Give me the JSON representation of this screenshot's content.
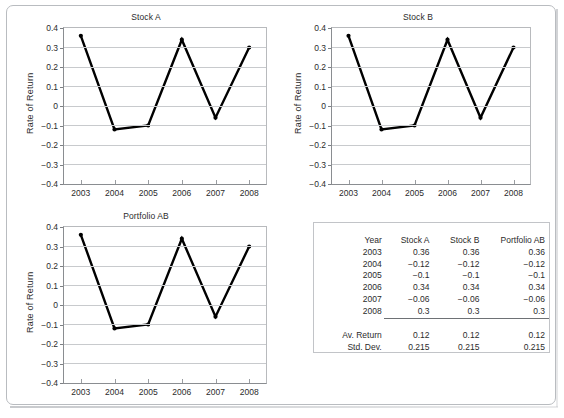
{
  "figure": {
    "background": "#ffffff",
    "line_color": "#000000",
    "grid_color": "#c8cacd",
    "axis_color": "#8a8d91",
    "text_color": "#2b2b2b"
  },
  "panels": [
    {
      "id": "stock-a",
      "title": "Stock A",
      "ylabel": "Rate of Return"
    },
    {
      "id": "stock-b",
      "title": "Stock B",
      "ylabel": "Rate of Return"
    },
    {
      "id": "portfolio-ab",
      "title": "Portfolio AB",
      "ylabel": "Rate of Return"
    }
  ],
  "axis": {
    "y_ticks": [
      "0.4",
      "0.3",
      "0.2",
      "0.1",
      "0",
      "-0.1",
      "-0.2",
      "-0.3",
      "-0.4"
    ],
    "x_ticks": [
      "2003",
      "2004",
      "2005",
      "2006",
      "2007",
      "2008"
    ],
    "ylim": [
      -0.4,
      0.4
    ]
  },
  "chart_data": [
    {
      "type": "line",
      "title": "Stock A",
      "xlabel": "",
      "ylabel": "Rate of Return",
      "x": [
        "2003",
        "2004",
        "2005",
        "2006",
        "2007",
        "2008"
      ],
      "values": [
        0.36,
        -0.12,
        -0.1,
        0.34,
        -0.06,
        0.3
      ],
      "ylim": [
        -0.4,
        0.4
      ],
      "ytick_step": 0.1,
      "grid": true,
      "legend": "none",
      "markers": true,
      "marker_style": "filled-circle",
      "line_color": "#000000"
    },
    {
      "type": "line",
      "title": "Stock B",
      "xlabel": "",
      "ylabel": "Rate of Return",
      "x": [
        "2003",
        "2004",
        "2005",
        "2006",
        "2007",
        "2008"
      ],
      "values": [
        0.36,
        -0.12,
        -0.1,
        0.34,
        -0.06,
        0.3
      ],
      "ylim": [
        -0.4,
        0.4
      ],
      "ytick_step": 0.1,
      "grid": true,
      "legend": "none",
      "markers": true,
      "marker_style": "filled-circle",
      "line_color": "#000000"
    },
    {
      "type": "line",
      "title": "Portfolio AB",
      "xlabel": "",
      "ylabel": "Rate of Return",
      "x": [
        "2003",
        "2004",
        "2005",
        "2006",
        "2007",
        "2008"
      ],
      "values": [
        0.36,
        -0.12,
        -0.1,
        0.34,
        -0.06,
        0.3
      ],
      "ylim": [
        -0.4,
        0.4
      ],
      "ytick_step": 0.1,
      "grid": true,
      "legend": "none",
      "markers": true,
      "marker_style": "filled-circle",
      "line_color": "#000000"
    },
    {
      "type": "table",
      "title": "",
      "columns": [
        "Year",
        "Stock A",
        "Stock B",
        "Portfolio AB"
      ],
      "rows": [
        [
          "2003",
          "0.36",
          "0.36",
          "0.36"
        ],
        [
          "2004",
          "-0.12",
          "-0.12",
          "-0.12"
        ],
        [
          "2005",
          "-0.1",
          "-0.1",
          "-0.1"
        ],
        [
          "2006",
          "0.34",
          "0.34",
          "0.34"
        ],
        [
          "2007",
          "-0.06",
          "-0.06",
          "-0.06"
        ],
        [
          "2008",
          "0.3",
          "0.3",
          "0.3"
        ]
      ],
      "summary": [
        [
          "Av. Return",
          "0.12",
          "0.12",
          "0.12"
        ],
        [
          "Std. Dev.",
          "0.215",
          "0.215",
          "0.215"
        ]
      ]
    }
  ],
  "table": {
    "header": {
      "year": "Year",
      "stock_a": "Stock A",
      "stock_b": "Stock B",
      "portfolio_ab": "Portfolio AB"
    },
    "rows": [
      {
        "year": "2003",
        "a": "0.36",
        "b": "0.36",
        "p": "0.36"
      },
      {
        "year": "2004",
        "a": "-0.12",
        "b": "-0.12",
        "p": "-0.12"
      },
      {
        "year": "2005",
        "a": "-0.1",
        "b": "-0.1",
        "p": "-0.1"
      },
      {
        "year": "2006",
        "a": "0.34",
        "b": "0.34",
        "p": "0.34"
      },
      {
        "year": "2007",
        "a": "-0.06",
        "b": "-0.06",
        "p": "-0.06"
      },
      {
        "year": "2008",
        "a": "0.3",
        "b": "0.3",
        "p": "0.3"
      }
    ],
    "summary": [
      {
        "label": "Av. Return",
        "a": "0.12",
        "b": "0.12",
        "p": "0.12"
      },
      {
        "label": "Std. Dev.",
        "a": "0.215",
        "b": "0.215",
        "p": "0.215"
      }
    ]
  }
}
